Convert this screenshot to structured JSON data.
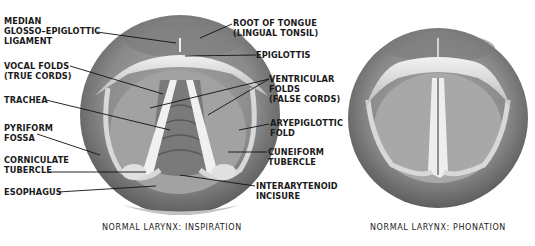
{
  "left_figure": {
    "caption": "NORMAL LARYNX: INSPIRATION",
    "labels": {
      "median_glosso": "MEDIAN\nGLOSSO–EPIGLOTTIC\nLIGAMENT",
      "vocal_folds": "VOCAL FOLDS\n(TRUE CORDS)",
      "trachea": "TRACHEA",
      "pyriform": "PYRIFORM\nFOSSA",
      "corniculate": "CORNICULATE\nTUBERCLE",
      "esophagus": "ESOPHAGUS",
      "root_tongue": "ROOT OF TONGUE\n(LINGUAL TONSIL)",
      "epiglottis": "EPIGLOTTIS",
      "ventricular": "VENTRICULAR\nFOLDS\n(FALSE CORDS)",
      "aryepiglottic": "ARYEPIGLOTTIC\nFOLD",
      "cuneiform": "CUNEIFORM\nTUBERCLE",
      "interarytenoid": "INTERARYTENOID\nINCISURE"
    }
  },
  "right_figure": {
    "caption": "NORMAL LARYNX: PHONATION"
  },
  "colors": {
    "background": "#ffffff",
    "tissue_dark": "#6a6a6a",
    "tissue_mid": "#9a9a9a",
    "tissue_light": "#d6d6d6",
    "cords": "#eeeeee",
    "text": "#1a1a1a"
  }
}
